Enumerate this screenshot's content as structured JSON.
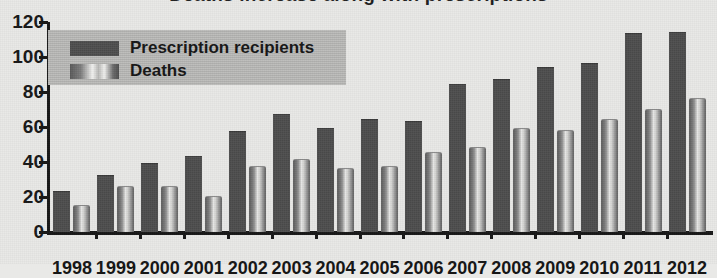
{
  "title": {
    "text": "Deaths increase along with prescriptions",
    "visible_fragment": true
  },
  "legend": {
    "position": "top-left-inside",
    "background_color": "#b9b9b7",
    "entries": [
      {
        "label": "Prescription recipients",
        "swatch": "dark-solid",
        "color": "#4a4a4a"
      },
      {
        "label": "Deaths",
        "swatch": "light-cylinder-gradient",
        "color": "#cfcfcd"
      }
    ]
  },
  "axes": {
    "y_ticks": [
      0,
      20,
      40,
      60,
      80,
      100,
      120
    ],
    "y_tick_labels": [
      "0",
      "20",
      "40",
      "60",
      "80",
      "100",
      "120"
    ],
    "ylim": [
      0,
      120
    ],
    "grid": false,
    "axis_color": "#161616"
  },
  "chart_data": {
    "type": "bar",
    "title": "Deaths increase along with prescriptions",
    "xlabel": "",
    "ylabel": "",
    "ylim": [
      0,
      120
    ],
    "grid": false,
    "legend_position": "upper-left",
    "categories": [
      "1998",
      "1999",
      "2000",
      "2001",
      "2002",
      "2003",
      "2004",
      "2005",
      "2006",
      "2007",
      "2008",
      "2009",
      "2010",
      "2011",
      "2012"
    ],
    "series": [
      {
        "name": "Prescription recipients",
        "color": "#4a4a4a",
        "values": [
          23,
          32,
          39,
          43,
          57,
          67,
          59,
          64,
          63,
          84,
          87,
          94,
          96,
          113,
          114
        ]
      },
      {
        "name": "Deaths",
        "color": "#cfcfcd",
        "values": [
          15,
          26,
          26,
          20,
          37,
          41,
          36,
          37,
          45,
          48,
          59,
          58,
          64,
          70,
          76
        ]
      }
    ]
  },
  "colors": {
    "background": "#e9e9e7",
    "prescription_bar": "#4a4a4a",
    "deaths_bar": "#cfcfcd",
    "axis": "#161616",
    "legend_bg": "#b9b9b7"
  }
}
